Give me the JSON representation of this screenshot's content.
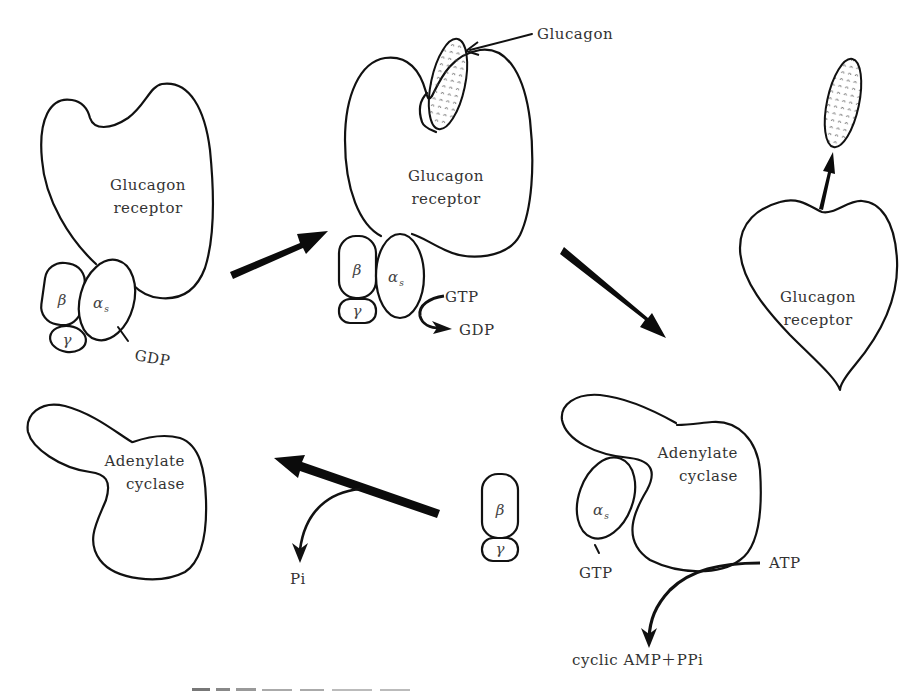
{
  "diagram": {
    "step1": {
      "receptor_label_line1": "Glucagon",
      "receptor_label_line2": "receptor",
      "beta_label": "β",
      "gamma_label": "γ",
      "alpha_label": "α",
      "alpha_sub": "s",
      "nucleotide_label": "GDP"
    },
    "step2": {
      "ligand_label": "Glucagon",
      "receptor_label_line1": "Glucagon",
      "receptor_label_line2": "receptor",
      "beta_label": "β",
      "gamma_label": "γ",
      "alpha_label": "α",
      "alpha_sub": "s",
      "in_label": "GTP",
      "out_label": "GDP"
    },
    "step3_receptor": {
      "receptor_label_line1": "Glucagon",
      "receptor_label_line2": "receptor"
    },
    "step3_cyclase": {
      "cyclase_label_line1": "Adenylate",
      "cyclase_label_line2": "cyclase",
      "alpha_label": "α",
      "alpha_sub": "s",
      "nucleotide_label": "GTP",
      "substrate_label": "ATP",
      "product_label": "cyclic  AMP＋PPi"
    },
    "step4": {
      "beta_label": "β",
      "gamma_label": "γ",
      "release_label": "Pi",
      "cyclase_label_line1": "Adenylate",
      "cyclase_label_line2": "cyclase"
    },
    "colors": {
      "stroke": "#111111",
      "text": "#333333",
      "background": "#ffffff"
    }
  }
}
